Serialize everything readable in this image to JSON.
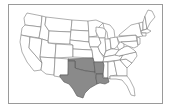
{
  "map": {
    "subject": "United States (contiguous 48 states)",
    "highlighted_states": [
      "Texas",
      "Oklahoma",
      "Arkansas",
      "Louisiana"
    ],
    "colors": {
      "highlight_fill": "#8a8a8a",
      "state_fill": "#ffffff",
      "border": "#7a7a7a",
      "frame_border": "#9a9a9a"
    }
  }
}
